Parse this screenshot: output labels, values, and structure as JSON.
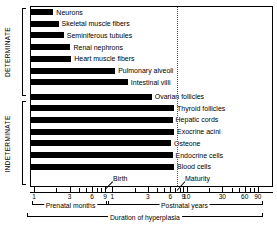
{
  "chart_data": {
    "type": "bar",
    "title": "",
    "xlabel": "Duration of hyperplasia",
    "ylabel": "",
    "orientation": "horizontal",
    "x_scale": "log (two segments: prenatal months, postnatal years)",
    "grid": false,
    "legend": false,
    "annotations": [
      "Birth",
      "Maturity"
    ],
    "groups": [
      {
        "name": "DETERMINATE",
        "categories": [
          "Neurons",
          "Skeletal muscle fibers",
          "Seminiferous tubules",
          "Renal nephrons",
          "Heart muscle fibers",
          "Pulmonary alveoli",
          "Intestinal villi"
        ],
        "values": [
          0.3,
          0.37,
          0.44,
          0.53,
          0.54,
          1.13,
          1.3
        ],
        "value_unit": "bar length in axis segments (prenatal=0-1, postnatal continues)",
        "end_labels": [
          "Neurons",
          "Skeletal muscle fibers",
          "Seminiferous tubules",
          "Renal nephrons",
          "Heart muscle fibers",
          "Pulmonary alveoli",
          "Intestinal villi"
        ]
      },
      {
        "name": "INDETERMINATE",
        "categories": [
          "Ovarian follicles",
          "Thyroid follicles",
          "Hepatic cords",
          "Exocrine acini",
          "Osteone",
          "Endocrine cells",
          "Blood cells"
        ],
        "values": [
          1.62,
          1.92,
          1.9,
          1.92,
          1.88,
          1.9,
          1.92
        ],
        "end_labels": [
          "Ovarian follicles",
          "Thyroid follicles",
          "Hepatic cords",
          "Exocrine acini",
          "Osteone",
          "Endocrine cells",
          "Blood cells"
        ]
      }
    ],
    "axis": {
      "prenatal": {
        "bracket_label": "Prenatal months",
        "tick_labels": [
          "1",
          "3",
          "6",
          "9"
        ],
        "all_ticks": [
          1,
          2,
          3,
          4,
          5,
          6,
          7,
          8,
          9
        ]
      },
      "postnatal": {
        "bracket_label": "Postnatal years",
        "tick_labels": [
          "1",
          "3",
          "6",
          "9",
          "10",
          "30",
          "60",
          "90"
        ],
        "all_ticks": [
          1,
          2,
          3,
          4,
          5,
          6,
          7,
          8,
          9,
          10,
          20,
          30,
          40,
          50,
          60,
          70,
          80,
          90
        ]
      },
      "overall_bracket_label": "Duration of hyperplasia"
    },
    "events": {
      "birth": "Birth",
      "maturity": "Maturity"
    }
  },
  "vertical_axis": {
    "determinate": "DETERMINATE",
    "indeterminate": "INDETERMINATE"
  }
}
